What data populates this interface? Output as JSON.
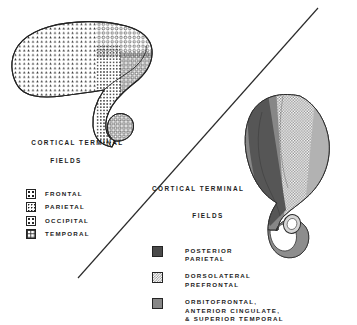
{
  "figure": {
    "panels": [
      {
        "id": "rodent-striatum-panel",
        "position": "upper-left",
        "legend": {
          "title_line1": "CORTICAL TERMINAL",
          "title_line2": "FIELDS",
          "items": [
            {
              "label": "FRONTAL",
              "pattern": "triangles",
              "swatch_class": "sw-triangles"
            },
            {
              "label": "PARIETAL",
              "pattern": "dots",
              "swatch_class": "sw-dots"
            },
            {
              "label": "OCCIPITAL",
              "pattern": "circles",
              "swatch_class": "sw-circles"
            },
            {
              "label": "TEMPORAL",
              "pattern": "squares",
              "swatch_class": "sw-squares"
            }
          ]
        }
      },
      {
        "id": "primate-striatum-panel",
        "position": "lower-right",
        "legend": {
          "title_line1": "CORTICAL TERMINAL",
          "title_line2": "FIELDS",
          "items": [
            {
              "label": "POSTERIOR\nPARIETAL",
              "pattern": "solid-dark-gray",
              "swatch_class": "sw-solid-dark"
            },
            {
              "label": "DORSOLATERAL\nPREFRONTAL",
              "pattern": "light-checker",
              "swatch_class": "sw-check-light"
            },
            {
              "label": "ORBITOFRONTAL,\nANTERIOR CINGULATE,\n& SUPERIOR TEMPORAL",
              "pattern": "mid-gray",
              "swatch_class": "sw-mid-gray"
            }
          ]
        }
      }
    ],
    "divider": {
      "type": "diagonal-line",
      "from": [
        78,
        278
      ],
      "to": [
        318,
        8
      ]
    },
    "colors": {
      "ink": "#1d1d1d",
      "outline": "#242424",
      "dark_gray": "#4a4a4a",
      "mid_gray": "#878787",
      "light_gray": "#b9b9b9",
      "checker_gray": "#8f8f8f",
      "background": "#ffffff"
    }
  }
}
